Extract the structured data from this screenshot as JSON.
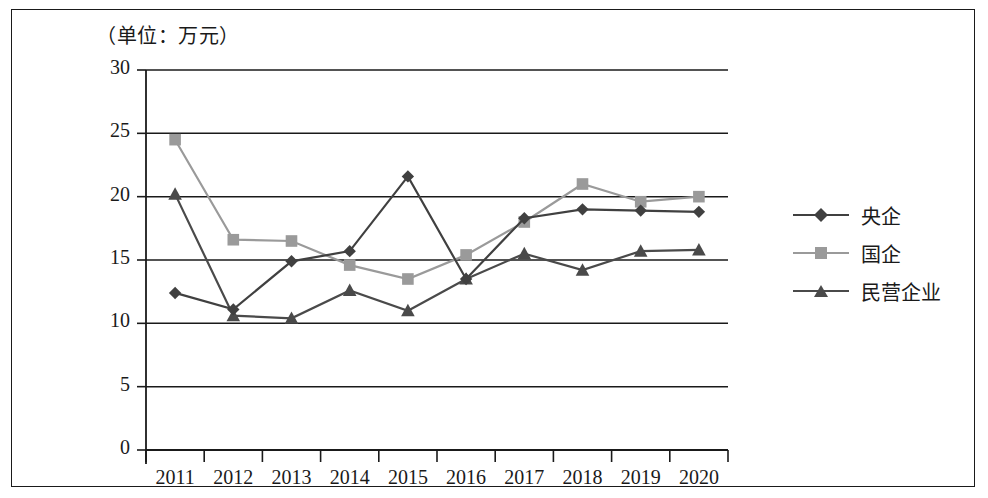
{
  "figure": {
    "unit_caption": "（单位：万元）",
    "border_color": "#1a1a1a",
    "background": "#ffffff"
  },
  "chart_data": {
    "type": "line",
    "title": "",
    "subtitle": "",
    "annotation": "（单位：万元）",
    "xlabel": "",
    "ylabel": "",
    "unit": "万元",
    "grid": true,
    "grid_axis": "y",
    "legend_position": "right",
    "categories": [
      "2011",
      "2012",
      "2013",
      "2014",
      "2015",
      "2016",
      "2017",
      "2018",
      "2019",
      "2020"
    ],
    "x": [
      "2011",
      "2012",
      "2013",
      "2014",
      "2015",
      "2016",
      "2017",
      "2018",
      "2019",
      "2020"
    ],
    "ylim": [
      0,
      30
    ],
    "yticks": [
      0,
      5,
      10,
      15,
      20,
      25,
      30
    ],
    "series": [
      {
        "name": "央企",
        "marker": "diamond",
        "color": "#404040",
        "values": [
          12.4,
          11.1,
          14.9,
          15.7,
          21.6,
          13.5,
          18.3,
          19.0,
          18.9,
          18.8
        ]
      },
      {
        "name": "国企",
        "marker": "square",
        "color": "#9a9a9a",
        "values": [
          24.5,
          16.6,
          16.5,
          14.6,
          13.5,
          15.4,
          18.0,
          21.0,
          19.6,
          20.0
        ]
      },
      {
        "name": "民营企业",
        "marker": "triangle",
        "color": "#4a4a4a",
        "values": [
          20.2,
          10.6,
          10.4,
          12.6,
          11.0,
          13.5,
          15.5,
          14.2,
          15.7,
          15.8
        ]
      }
    ]
  },
  "legend": {
    "items": [
      {
        "label": "央企",
        "marker": "diamond",
        "color": "#404040"
      },
      {
        "label": "国企",
        "marker": "square",
        "color": "#9a9a9a"
      },
      {
        "label": "民营企业",
        "marker": "triangle",
        "color": "#4a4a4a"
      }
    ]
  },
  "axes": {
    "y_tick_labels": [
      "30",
      "25",
      "20",
      "15",
      "10",
      "5",
      "0"
    ],
    "x_tick_labels": [
      "2011",
      "2012",
      "2013",
      "2014",
      "2015",
      "2016",
      "2017",
      "2018",
      "2019",
      "2020"
    ],
    "axis_color": "#1a1a1a"
  }
}
